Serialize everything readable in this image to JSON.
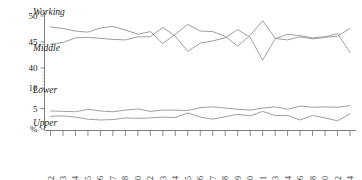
{
  "chart_data": {
    "type": "line",
    "title": "",
    "subtitle": "",
    "xlabel": "",
    "ylabel": "%",
    "grid": false,
    "legend_position": "inline-left",
    "axis_note": "broken y-axis: upper band 40-50, lower band 0-10",
    "ylim_upper": [
      40,
      50
    ],
    "ylim_lower": [
      0,
      10
    ],
    "ytick_labels_upper": [
      "50",
      "45",
      "40"
    ],
    "ytick_labels_lower": [
      "10",
      "5",
      "%"
    ],
    "ytick_values_upper": [
      50,
      45,
      40
    ],
    "ytick_values_lower": [
      10,
      5,
      0
    ],
    "categories": [
      "1972",
      "1973",
      "1974",
      "1975",
      "1976",
      "1977",
      "1978",
      "1980",
      "1982",
      "1983",
      "1984",
      "1985",
      "1986",
      "1987",
      "1988",
      "1989",
      "1990",
      "1991",
      "1993",
      "1994",
      "1996",
      "1998",
      "2000",
      "2002",
      "2004"
    ],
    "series": [
      {
        "name": "Working",
        "label": "Working",
        "color": "#8e8e8e",
        "band": "upper",
        "values": [
          47.9,
          47.6,
          47.1,
          46.9,
          47.7,
          48.0,
          47.3,
          46.5,
          47.0,
          44.7,
          46.5,
          48.4,
          47.1,
          47.0,
          46.1,
          44.2,
          46.3,
          49.1,
          45.7,
          45.4,
          46.0,
          45.6,
          45.9,
          46.1,
          47.6
        ]
      },
      {
        "name": "Middle",
        "label": "Middle",
        "color": "#8e8e8e",
        "band": "upper",
        "values": [
          44.6,
          44.9,
          45.8,
          45.9,
          45.7,
          45.5,
          45.4,
          46.0,
          46.0,
          47.8,
          46.1,
          43.2,
          44.8,
          45.2,
          45.8,
          47.4,
          45.9,
          41.5,
          45.6,
          46.5,
          46.2,
          45.8,
          46.0,
          46.6,
          43.0
        ]
      },
      {
        "name": "Lower",
        "label": "Lower",
        "color": "#8e8e8e",
        "band": "lower",
        "values": [
          4.4,
          4.3,
          4.2,
          4.8,
          4.4,
          4.2,
          4.6,
          4.9,
          4.3,
          4.6,
          4.6,
          4.5,
          5.2,
          5.4,
          5.1,
          4.8,
          4.6,
          5.1,
          5.4,
          4.8,
          5.6,
          5.3,
          5.4,
          5.3,
          5.7
        ]
      },
      {
        "name": "Upper",
        "label": "Upper",
        "color": "#8e8e8e",
        "band": "lower",
        "values": [
          3.1,
          3.2,
          2.9,
          2.4,
          2.2,
          2.3,
          2.7,
          2.6,
          2.7,
          2.9,
          2.8,
          3.9,
          2.9,
          2.4,
          3.0,
          3.6,
          3.2,
          4.3,
          3.3,
          3.3,
          2.2,
          3.3,
          2.7,
          2.0,
          3.7
        ]
      }
    ]
  }
}
